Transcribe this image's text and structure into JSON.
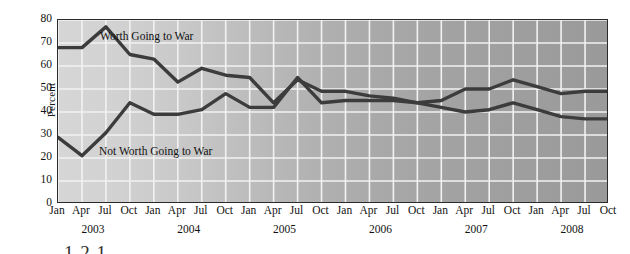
{
  "chart_data": {
    "type": "line",
    "title": "",
    "xlabel": "",
    "ylabel": "Percent",
    "ylim": [
      0,
      80
    ],
    "ytick_values": [
      0,
      10,
      20,
      30,
      40,
      50,
      60,
      70,
      80
    ],
    "ytick_labels": [
      "0",
      "10",
      "20",
      "30",
      "40",
      "50",
      "60",
      "70",
      "80"
    ],
    "grid": true,
    "legend_position": "inline-annotations",
    "x": [
      "Jan 2003",
      "Apr 2003",
      "Jul 2003",
      "Oct 2003",
      "Jan 2004",
      "Apr 2004",
      "Jul 2004",
      "Oct 2004",
      "Jan 2005",
      "Apr 2005",
      "Jul 2005",
      "Oct 2005",
      "Jan 2006",
      "Apr 2006",
      "Jul 2006",
      "Oct 2006",
      "Jan 2007",
      "Apr 2007",
      "Jul 2007",
      "Oct 2007",
      "Jan 2008",
      "Apr 2008",
      "Jul 2008",
      "Oct 2008"
    ],
    "xtick_labels": [
      "Jan",
      "Apr",
      "Jul",
      "Oct",
      "Jan",
      "Apr",
      "Jul",
      "Oct",
      "Jan",
      "Apr",
      "Jul",
      "Oct",
      "Jan",
      "Apr",
      "Jul",
      "Oct",
      "Jan",
      "Apr",
      "Jul",
      "Oct",
      "Jan",
      "Apr",
      "Jul",
      "Oct"
    ],
    "year_labels": [
      "2003",
      "2004",
      "2005",
      "2006",
      "2007",
      "2008"
    ],
    "series": [
      {
        "name": "Worth Going to War",
        "color": "#3c3c3c",
        "values": [
          68,
          68,
          77,
          65,
          63,
          53,
          59,
          56,
          55,
          44,
          54,
          49,
          49,
          47,
          46,
          44,
          45,
          50,
          50,
          54,
          51,
          48,
          49,
          49
        ]
      },
      {
        "name": "Not Worth Going to War",
        "color": "#3c3c3c",
        "values": [
          29,
          21,
          31,
          44,
          39,
          39,
          41,
          48,
          42,
          42,
          55,
          44,
          45,
          45,
          45,
          44,
          42,
          40,
          41,
          44,
          41,
          38,
          37,
          37
        ]
      }
    ]
  },
  "annotations": {
    "worth_label": "Worth Going to War",
    "not_worth_label": "Not Worth Going to War"
  },
  "caption": {
    "fragment": "1 2 1"
  }
}
